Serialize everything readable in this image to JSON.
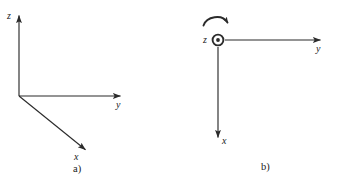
{
  "figure": {
    "background_color": "#ffffff",
    "stroke_color": "#2b2b2b",
    "text_color": "#1a1a1a",
    "width": 340,
    "height": 184
  },
  "panel_a": {
    "caption": "a)",
    "description": "three-dimensional right-handed cartesian coordinate frame in oblique projection",
    "axes": [
      {
        "name": "z-axis",
        "label": "z",
        "direction": "up",
        "origin": [
          19,
          96
        ],
        "tip": [
          19,
          14
        ]
      },
      {
        "name": "y-axis",
        "label": "y",
        "direction": "right",
        "origin": [
          19,
          96
        ],
        "tip": [
          122,
          96
        ]
      },
      {
        "name": "x-axis",
        "label": "x",
        "direction": "down-right (out of page, oblique)",
        "origin": [
          19,
          96
        ],
        "tip": [
          87,
          151
        ]
      }
    ]
  },
  "panel_b": {
    "caption": "b)",
    "description": "same frame viewed along the z-axis; z points out of the page",
    "z_symbol": "circle-dot",
    "z_symbol_meaning": "vector out of page",
    "rotation_arrow": {
      "name": "counterclockwise-rotation-arrow",
      "direction": "clockwise-on-screen arc above origin",
      "label": ""
    },
    "axes": [
      {
        "name": "z-axis",
        "label": "z",
        "direction": "out of page",
        "origin": [
          48,
          40
        ]
      },
      {
        "name": "y-axis",
        "label": "y",
        "direction": "right",
        "origin": [
          48,
          40
        ],
        "tip": [
          152,
          40
        ]
      },
      {
        "name": "x-axis",
        "label": "x",
        "direction": "down",
        "origin": [
          48,
          40
        ],
        "tip": [
          48,
          139
        ]
      }
    ]
  }
}
